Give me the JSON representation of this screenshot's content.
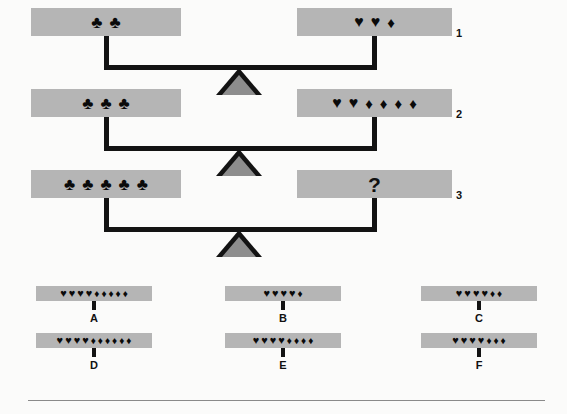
{
  "puzzle": {
    "title": "Balance scale weight puzzle",
    "unknown_marker": "?",
    "symbols": {
      "club": "♣",
      "heart": "♥",
      "diamond": "♦"
    },
    "rows": [
      {
        "number": "1",
        "left": {
          "clubs": 2,
          "hearts": 0,
          "diamonds": 0,
          "text": "♣ ♣"
        },
        "right": {
          "clubs": 0,
          "hearts": 2,
          "diamonds": 1,
          "text": "♥ ♥ ♦"
        },
        "balanced": true
      },
      {
        "number": "2",
        "left": {
          "clubs": 3,
          "hearts": 0,
          "diamonds": 0,
          "text": "♣ ♣ ♣"
        },
        "right": {
          "clubs": 0,
          "hearts": 2,
          "diamonds": 4,
          "text": "♥ ♥ ♦ ♦ ♦ ♦"
        },
        "balanced": true
      },
      {
        "number": "3",
        "left": {
          "clubs": 5,
          "hearts": 0,
          "diamonds": 0,
          "text": "♣ ♣ ♣ ♣ ♣"
        },
        "right": {
          "clubs": 0,
          "hearts": 0,
          "diamonds": 0,
          "text": "?"
        },
        "balanced": true
      }
    ],
    "options": [
      {
        "letter": "A",
        "hearts": 4,
        "diamonds": 5,
        "text": "♥♥♥♥♦♦♦♦♦"
      },
      {
        "letter": "B",
        "hearts": 4,
        "diamonds": 1,
        "text": "♥♥♥♥♦"
      },
      {
        "letter": "C",
        "hearts": 4,
        "diamonds": 2,
        "text": "♥♥♥♥♦♦"
      },
      {
        "letter": "D",
        "hearts": 4,
        "diamonds": 6,
        "text": "♥♥♥♥♦♦♦♦♦♦"
      },
      {
        "letter": "E",
        "hearts": 4,
        "diamonds": 4,
        "text": "♥♥♥♥♦♦♦♦"
      },
      {
        "letter": "F",
        "hearts": 4,
        "diamonds": 3,
        "text": "♥♥♥♥♦♦♦"
      }
    ]
  },
  "colors": {
    "pan_fill": "#b5b5b5",
    "beam": "#131313",
    "fulcrum_fill": "#8d8d8d",
    "fulcrum_outline": "#131313",
    "symbol": "#0a0a0a",
    "background": "#fbfbfa",
    "rule": "#8a8a8a"
  }
}
